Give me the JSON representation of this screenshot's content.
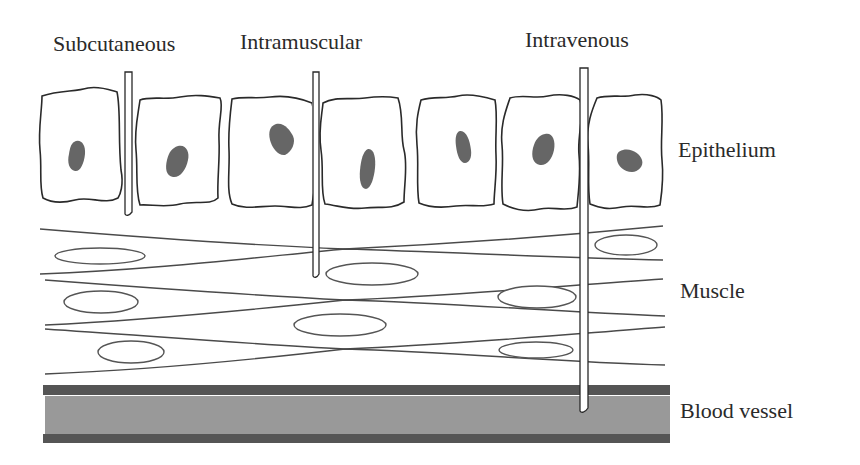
{
  "diagram": {
    "needles": [
      {
        "label": "Subcutaneous"
      },
      {
        "label": "Intramuscular"
      },
      {
        "label": "Intravenous"
      }
    ],
    "layers": [
      {
        "label": "Epithelium"
      },
      {
        "label": "Muscle"
      },
      {
        "label": "Blood vessel"
      }
    ],
    "colors": {
      "vessel_wall": "#555555",
      "vessel_lumen": "#999999",
      "nucleus": "#666666",
      "line": "#2a2a2a"
    }
  }
}
